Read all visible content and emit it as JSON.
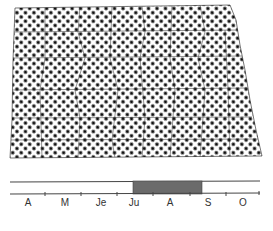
{
  "map": {
    "region": "North Dakota county outline",
    "fill_pattern": "dot-halftone",
    "dot_color": "#111111",
    "background_color": "#ffffff",
    "outline_color": "#333333"
  },
  "timeline": {
    "months": [
      {
        "label": "A",
        "x": 28
      },
      {
        "label": "M",
        "x": 65
      },
      {
        "label": "Je",
        "x": 101
      },
      {
        "label": "Ju",
        "x": 134
      },
      {
        "label": "A",
        "x": 170
      },
      {
        "label": "S",
        "x": 208
      },
      {
        "label": "O",
        "x": 243
      }
    ],
    "highlight": {
      "start_label": "Ju",
      "end_label": "S",
      "color": "#6b6b6b"
    },
    "line_color": "#444444"
  }
}
